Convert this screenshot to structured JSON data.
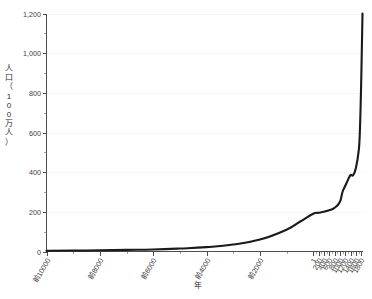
{
  "chart_data": {
    "type": "line",
    "title": "",
    "xlabel": "年",
    "ylabel": "人口（100万人）",
    "ylim": [
      0,
      1200
    ],
    "xlim": [
      -10000,
      1850
    ],
    "grid": true,
    "legend": "none",
    "y_ticks": [
      0,
      200,
      400,
      600,
      800,
      1000,
      1200
    ],
    "y_tick_labels": [
      "0",
      "200",
      "400",
      "600",
      "800",
      "1,000",
      "1,200"
    ],
    "y_minor_tick_step": 100,
    "x_ticks": [
      -10000,
      -8000,
      -6000,
      -4000,
      -2000,
      1,
      200,
      400,
      600,
      800,
      1000,
      1200,
      1400,
      1600,
      1800
    ],
    "x_tick_labels": [
      "前10000",
      "前8000",
      "前6000",
      "前4000",
      "前2000",
      "1",
      "200",
      "400",
      "600",
      "800",
      "1000",
      "1200",
      "1400",
      "1600",
      "1800"
    ],
    "x": [
      -10000,
      -9000,
      -8000,
      -7000,
      -6000,
      -5000,
      -4000,
      -3000,
      -2000,
      -1000,
      -500,
      1,
      200,
      400,
      600,
      800,
      1000,
      1100,
      1200,
      1300,
      1400,
      1500,
      1600,
      1700,
      1750,
      1800,
      1850
    ],
    "values": [
      4,
      5,
      6,
      8,
      10,
      15,
      22,
      35,
      60,
      110,
      150,
      190,
      195,
      200,
      208,
      220,
      250,
      300,
      330,
      360,
      385,
      385,
      420,
      500,
      600,
      850,
      1200
    ],
    "series": [
      {
        "name": "世界人口",
        "color": "#1a1a1a",
        "values": [
          4,
          5,
          6,
          8,
          10,
          15,
          22,
          35,
          60,
          110,
          150,
          190,
          195,
          200,
          208,
          220,
          250,
          300,
          330,
          360,
          385,
          385,
          420,
          500,
          600,
          850,
          1200
        ]
      }
    ]
  },
  "axis": {
    "y_label_chars": [
      "人",
      "口",
      "（",
      "1",
      "0",
      "0",
      "万",
      "人",
      "）"
    ],
    "x_title": "年"
  }
}
